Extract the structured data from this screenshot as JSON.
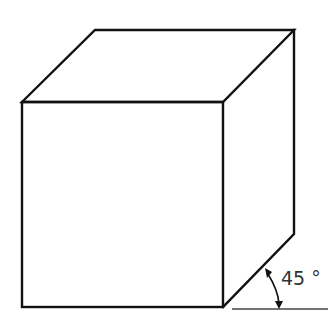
{
  "diagram": {
    "type": "isometric-cube",
    "angle_label": "45 °",
    "colors": {
      "stroke": "#111111",
      "ground": "#444444",
      "text": "#333333",
      "background": "#ffffff"
    }
  }
}
